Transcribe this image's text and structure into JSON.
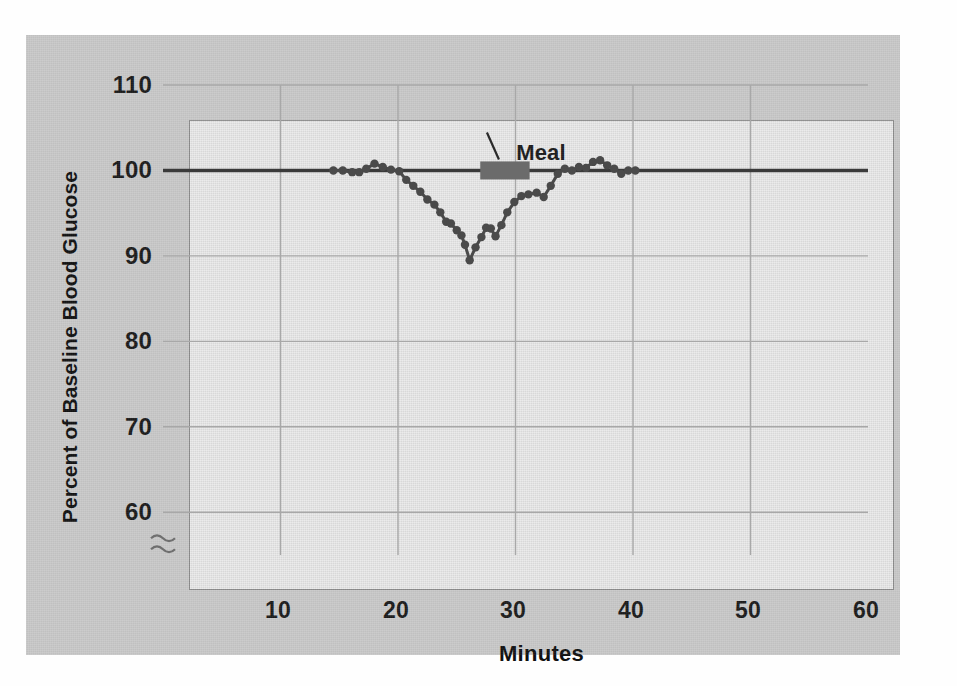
{
  "figure": {
    "background_color": "#c9c9c9",
    "plot_background_color": "#e9e9e9",
    "line_color": "#4a4a4a",
    "baseline_color": "#3a3a3a",
    "grid_color": "#a8a8a8",
    "meal_bar_color": "#6b6b6b"
  },
  "chart_data": {
    "type": "line",
    "title": "",
    "xlabel": "Minutes",
    "ylabel": "Percent of Baseline Blood Glucose",
    "xlim": [
      0,
      60
    ],
    "ylim": [
      55,
      110
    ],
    "xticks": [
      10,
      20,
      30,
      40,
      50,
      60
    ],
    "yticks": [
      60,
      70,
      80,
      90,
      100,
      110
    ],
    "xtick_labels": [
      "10",
      "20",
      "30",
      "40",
      "50",
      "60"
    ],
    "ytick_labels": [
      "60",
      "70",
      "80",
      "90",
      "100",
      "110"
    ],
    "grid": true,
    "legend": "none",
    "y_axis_break": true,
    "y_axis_break_note": "axis break squiggle below 60",
    "baseline": {
      "value": 100,
      "label": "baseline 100%",
      "spans_full_width": true
    },
    "annotations": [
      {
        "name": "meal",
        "text": "Meal",
        "bar_x_start": 27.0,
        "bar_x_end": 31.2,
        "bar_y": 100,
        "leader_line": true
      }
    ],
    "series": [
      {
        "name": "Percent of baseline blood glucose",
        "marker": "circle",
        "points": [
          [
            14.5,
            100.0
          ],
          [
            15.3,
            100.0
          ],
          [
            16.1,
            99.8
          ],
          [
            16.7,
            99.8
          ],
          [
            17.3,
            100.2
          ],
          [
            18.0,
            100.8
          ],
          [
            18.7,
            100.4
          ],
          [
            19.4,
            100.1
          ],
          [
            20.1,
            99.9
          ],
          [
            20.7,
            98.9
          ],
          [
            21.3,
            98.2
          ],
          [
            21.9,
            97.5
          ],
          [
            22.5,
            96.6
          ],
          [
            23.1,
            96.0
          ],
          [
            23.6,
            95.1
          ],
          [
            24.1,
            94.0
          ],
          [
            24.5,
            93.8
          ],
          [
            25.0,
            93.0
          ],
          [
            25.4,
            92.4
          ],
          [
            25.7,
            91.3
          ],
          [
            26.1,
            89.5
          ],
          [
            26.6,
            91.0
          ],
          [
            27.1,
            92.2
          ],
          [
            27.5,
            93.3
          ],
          [
            27.9,
            93.2
          ],
          [
            28.3,
            92.3
          ],
          [
            28.8,
            93.6
          ],
          [
            29.3,
            95.1
          ],
          [
            29.9,
            96.3
          ],
          [
            30.5,
            97.0
          ],
          [
            31.1,
            97.2
          ],
          [
            31.8,
            97.4
          ],
          [
            32.4,
            96.9
          ],
          [
            33.0,
            98.2
          ],
          [
            33.6,
            99.6
          ],
          [
            34.2,
            100.2
          ],
          [
            34.8,
            100.0
          ],
          [
            35.4,
            100.4
          ],
          [
            36.0,
            100.3
          ],
          [
            36.6,
            101.0
          ],
          [
            37.2,
            101.2
          ],
          [
            37.8,
            100.6
          ],
          [
            38.4,
            100.2
          ],
          [
            39.0,
            99.6
          ],
          [
            39.6,
            100.0
          ],
          [
            40.2,
            100.0
          ]
        ]
      }
    ]
  }
}
